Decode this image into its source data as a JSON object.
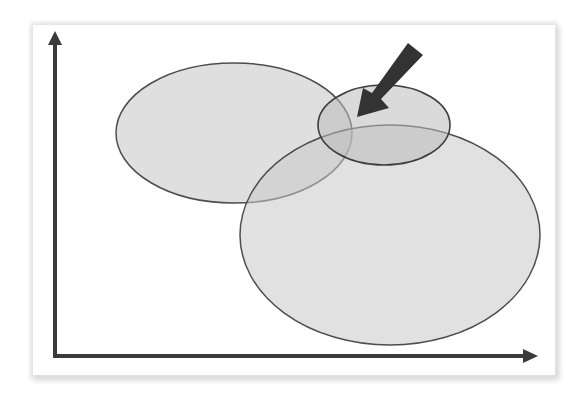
{
  "diagram": {
    "type": "overlapping-ellipses-on-axes",
    "colors": {
      "background": "#ffffff",
      "axis": "#3a3a3a",
      "ellipse_fill": "#c8c8c8",
      "ellipse_stroke": "#4a4a4a",
      "arrow": "#333333"
    },
    "axes": {
      "x_axis": {
        "label": ""
      },
      "y_axis": {
        "label": ""
      }
    },
    "ellipses": [
      {
        "id": "left",
        "cx": 234,
        "cy": 133,
        "rx": 118,
        "ry": 70
      },
      {
        "id": "large-bottom-right",
        "cx": 390,
        "cy": 235,
        "rx": 150,
        "ry": 110
      },
      {
        "id": "small-top",
        "cx": 384,
        "cy": 125,
        "rx": 66,
        "ry": 40
      }
    ],
    "pointer_arrow": {
      "direction": "down-left",
      "target": "overlap-region",
      "tail": [
        416,
        49
      ],
      "tip": [
        357,
        117
      ]
    }
  }
}
